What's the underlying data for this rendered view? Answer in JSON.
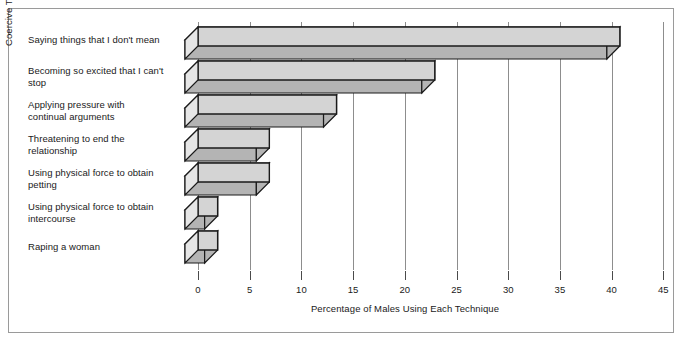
{
  "chart_data": {
    "type": "bar",
    "orientation": "horizontal",
    "style": "3d-extruded-bar",
    "title": "",
    "xlabel": "Percentage of Males Using Each Technique",
    "ylabel": "Coercive Techniques Used by Males to Obtain Sex",
    "categories": [
      "Saying things that I don't mean",
      "Becoming so excited that I can't stop",
      "Applying pressure with continual arguments",
      "Threatening to end the relationship",
      "Using physical force to obtain petting",
      "Using physical force to obtain intercourse",
      "Raping a woman"
    ],
    "values": [
      40.8,
      22.9,
      13.4,
      6.9,
      6.9,
      1.9,
      1.9
    ],
    "xlim": [
      0,
      45
    ],
    "xticks": [
      0,
      5,
      10,
      15,
      20,
      25,
      30,
      35,
      40,
      45
    ],
    "xtick_labels": [
      "0",
      "5",
      "10",
      "15",
      "20",
      "25",
      "30",
      "35",
      "40",
      "45"
    ],
    "grid": true,
    "grid_axis": "x",
    "legend": false,
    "bar_face_color": "#d4d4d4",
    "bar_top_color": "#e6e6e6",
    "bar_side_color": "#b4b4b4",
    "bar_edge_color": "#1a1a1a",
    "gridline_color": "#8d8d8d",
    "frame_color": "#9a9a9a",
    "background_color": "#ffffff"
  },
  "labels": {
    "cat0": "Saying things that I don't mean",
    "cat1_line1": "Becoming so excited that I can't",
    "cat1_line2": "stop",
    "cat2_line1": "Applying pressure with",
    "cat2_line2": "continual arguments",
    "cat3_line1": "Threatening to end the",
    "cat3_line2": "relationship",
    "cat4_line1": "Using physical force to obtain",
    "cat4_line2": "petting",
    "cat5_line1": "Using physical force to obtain",
    "cat5_line2": "intercourse",
    "cat6": "Raping a woman"
  },
  "axis": {
    "y_title": "Coercive Techniques Used by Males to Obtain Sex",
    "x_title": "Percentage of Males Using Each Technique",
    "x_ticks": [
      "0",
      "5",
      "10",
      "15",
      "20",
      "25",
      "30",
      "35",
      "40",
      "45"
    ]
  }
}
